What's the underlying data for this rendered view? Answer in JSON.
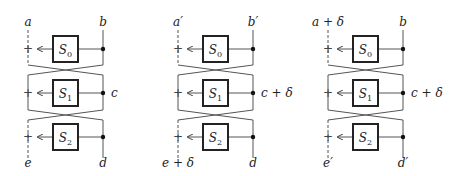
{
  "panels": [
    {
      "id": "panel-1",
      "labels": {
        "top_left": "a",
        "top_right": "b",
        "middle_right": "c",
        "bottom_left": "e",
        "bottom_right": "d"
      },
      "boxes": [
        {
          "name": "S",
          "sub": "0"
        },
        {
          "name": "S",
          "sub": "1"
        },
        {
          "name": "S",
          "sub": "2"
        }
      ]
    },
    {
      "id": "panel-2",
      "labels": {
        "top_left": "a′",
        "top_right": "b′",
        "middle_right": "c + δ",
        "bottom_left": "e + δ",
        "bottom_right": "d"
      },
      "boxes": [
        {
          "name": "S",
          "sub": "0"
        },
        {
          "name": "S",
          "sub": "1"
        },
        {
          "name": "S",
          "sub": "2"
        }
      ]
    },
    {
      "id": "panel-3",
      "labels": {
        "top_left": "a + δ",
        "top_right": "b",
        "middle_right": "c + δ",
        "bottom_left": "e′",
        "bottom_right": "d′"
      },
      "boxes": [
        {
          "name": "S",
          "sub": "0"
        },
        {
          "name": "S",
          "sub": "1"
        },
        {
          "name": "S",
          "sub": "2"
        }
      ]
    }
  ],
  "symbols": {
    "plus": "+"
  }
}
